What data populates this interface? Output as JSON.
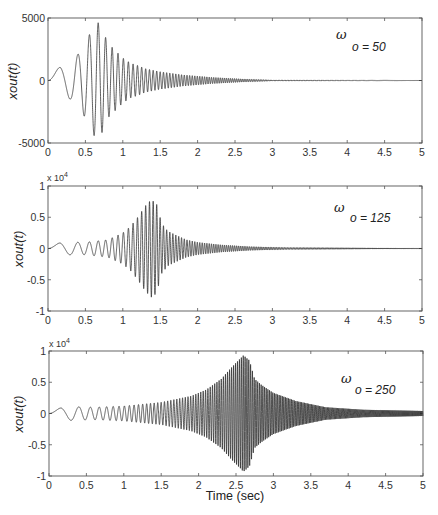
{
  "chart_data": [
    {
      "type": "line",
      "panel": 1,
      "title": "",
      "annotation": {
        "symbol": "ω",
        "text": "o = 50"
      },
      "xlabel": "",
      "ylabel": "xout(t)",
      "xlim": [
        0,
        5
      ],
      "ylim": [
        -5000,
        5000
      ],
      "y_exponent": "",
      "xticks": [
        "0",
        "0.5",
        "1",
        "1.5",
        "2",
        "2.5",
        "3",
        "3.5",
        "4",
        "4.5",
        "5"
      ],
      "yticks": [
        "-5000",
        "0",
        "5000"
      ],
      "ytick_values": [
        -5000,
        0,
        5000
      ],
      "grid": false,
      "series": [
        {
          "name": "xout(t)",
          "description": "Chirp response passing resonance at omega_o = 50 rad/s; envelope peaks near t=0.65 s then decays",
          "envelope_t": [
            0,
            0.17,
            0.3,
            0.4,
            0.5,
            0.58,
            0.65,
            0.72,
            0.8,
            0.9,
            1.0,
            1.1,
            1.2,
            1.3,
            1.5,
            1.8,
            2.2,
            2.6,
            3.0,
            5.0
          ],
          "envelope_v": [
            0,
            1200,
            1500,
            2100,
            3000,
            4000,
            4800,
            4200,
            3000,
            2400,
            1800,
            1400,
            1200,
            950,
            700,
            450,
            250,
            120,
            40,
            0
          ],
          "peak_value": 4800,
          "peak_time": 0.65
        }
      ]
    },
    {
      "type": "line",
      "panel": 2,
      "title": "",
      "annotation": {
        "symbol": "ω",
        "text": "o = 125"
      },
      "xlabel": "",
      "ylabel": "xout(t)",
      "xlim": [
        0,
        5
      ],
      "ylim": [
        -1,
        1
      ],
      "y_exponent": "x 10^4",
      "xticks": [
        "0",
        "0.5",
        "1",
        "1.5",
        "2",
        "2.5",
        "3",
        "3.5",
        "4",
        "4.5",
        "5"
      ],
      "yticks": [
        "-1",
        "-0.5",
        "0",
        "0.5",
        "1"
      ],
      "ytick_values": [
        -1,
        -0.5,
        0,
        0.5,
        1
      ],
      "grid": false,
      "series": [
        {
          "name": "xout(t)",
          "description": "Chirp response passing resonance at omega_o = 125 rad/s; envelope peaks near t=1.38 s (~0.78e4)",
          "envelope_t": [
            0,
            0.17,
            0.3,
            0.5,
            0.8,
            1.0,
            1.1,
            1.2,
            1.3,
            1.38,
            1.45,
            1.52,
            1.6,
            1.7,
            1.85,
            2.0,
            2.3,
            2.7,
            3.2,
            5.0
          ],
          "envelope_v": [
            0,
            0.1,
            0.1,
            0.1,
            0.14,
            0.25,
            0.35,
            0.5,
            0.68,
            0.78,
            0.72,
            0.4,
            0.28,
            0.22,
            0.14,
            0.1,
            0.06,
            0.03,
            0.015,
            0.005
          ],
          "peak_value": 0.78,
          "peak_time": 1.38
        }
      ]
    },
    {
      "type": "line",
      "panel": 3,
      "title": "",
      "annotation": {
        "symbol": "ω",
        "text": "o = 250"
      },
      "xlabel": "Time (sec)",
      "ylabel": "xout(t)",
      "xlim": [
        0,
        5
      ],
      "ylim": [
        -1,
        1
      ],
      "y_exponent": "x 10^4",
      "xticks": [
        "0",
        "0.5",
        "1",
        "1.5",
        "2",
        "2.5",
        "3",
        "3.5",
        "4",
        "4.5",
        "5"
      ],
      "yticks": [
        "-1",
        "-0.5",
        "0",
        "0.5",
        "1"
      ],
      "ytick_values": [
        -1,
        -0.5,
        0,
        0.5,
        1
      ],
      "grid": false,
      "series": [
        {
          "name": "xout(t)",
          "description": "Chirp response passing resonance at omega_o = 250 rad/s; envelope peaks near t=2.6 s (~0.93e4)",
          "envelope_t": [
            0,
            0.17,
            0.3,
            0.6,
            1.0,
            1.5,
            1.9,
            2.1,
            2.3,
            2.45,
            2.6,
            2.68,
            2.75,
            2.85,
            3.0,
            3.3,
            3.7,
            4.2,
            5.0
          ],
          "envelope_v": [
            0,
            0.1,
            0.11,
            0.1,
            0.12,
            0.18,
            0.28,
            0.38,
            0.55,
            0.75,
            0.93,
            0.85,
            0.55,
            0.45,
            0.33,
            0.2,
            0.1,
            0.06,
            0.04
          ],
          "peak_value": 0.93,
          "peak_time": 2.6
        }
      ]
    }
  ],
  "chirp": {
    "f_base_hz": 1.6,
    "sweep_k": 16.3,
    "sweep_t0": 0.28
  },
  "axis_label": {
    "y": "xout(t)",
    "x": "Time (sec)"
  },
  "colors": {
    "trace": "#2a2a2a",
    "axes": "#555555",
    "background": "#ffffff"
  }
}
